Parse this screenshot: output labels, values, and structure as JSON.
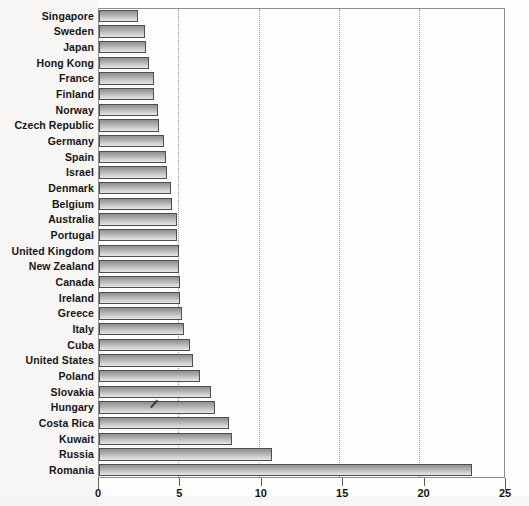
{
  "chart_data": {
    "type": "bar",
    "orientation": "horizontal",
    "title": "",
    "subtitle": "",
    "xlabel": "",
    "ylabel": "",
    "xlim": [
      0,
      25
    ],
    "ylim": null,
    "grid": true,
    "gridlines": "vertical dotted at every major x tick",
    "legend": null,
    "legend_position": "none",
    "xticks": [
      0,
      5,
      10,
      15,
      20,
      25
    ],
    "xtick_labels": [
      "0",
      "5",
      "10",
      "15",
      "20",
      "25"
    ],
    "categories": [
      "Singapore",
      "Sweden",
      "Japan",
      "Hong Kong",
      "France",
      "Finland",
      "Norway",
      "Czech Republic",
      "Germany",
      "Spain",
      "Israel",
      "Denmark",
      "Belgium",
      "Australia",
      "Portugal",
      "United Kingdom",
      "New Zealand",
      "Canada",
      "Ireland",
      "Greece",
      "Italy",
      "Cuba",
      "United States",
      "Poland",
      "Slovakia",
      "Hungary",
      "Costa Rica",
      "Kuwait",
      "Russia",
      "Romania"
    ],
    "values": [
      2.4,
      2.8,
      2.9,
      3.1,
      3.4,
      3.4,
      3.6,
      3.7,
      4.0,
      4.1,
      4.2,
      4.4,
      4.5,
      4.8,
      4.8,
      4.9,
      4.9,
      5.0,
      5.0,
      5.1,
      5.2,
      5.6,
      5.8,
      6.2,
      6.9,
      7.1,
      8.0,
      8.2,
      10.6,
      22.9
    ],
    "series_name": "",
    "bar_style": {
      "fill": "vertical grey gradient",
      "fill_top": "#8f8f8f",
      "fill_bottom": "#e6e6e6",
      "border": "#4e4e4e"
    },
    "annotations": [
      {
        "name": "pen-mark",
        "description": "small handwritten pen stroke over the Hungary bar"
      }
    ]
  },
  "axis": {
    "x_tick_labels": [
      "0",
      "5",
      "10",
      "15",
      "20",
      "25"
    ]
  }
}
